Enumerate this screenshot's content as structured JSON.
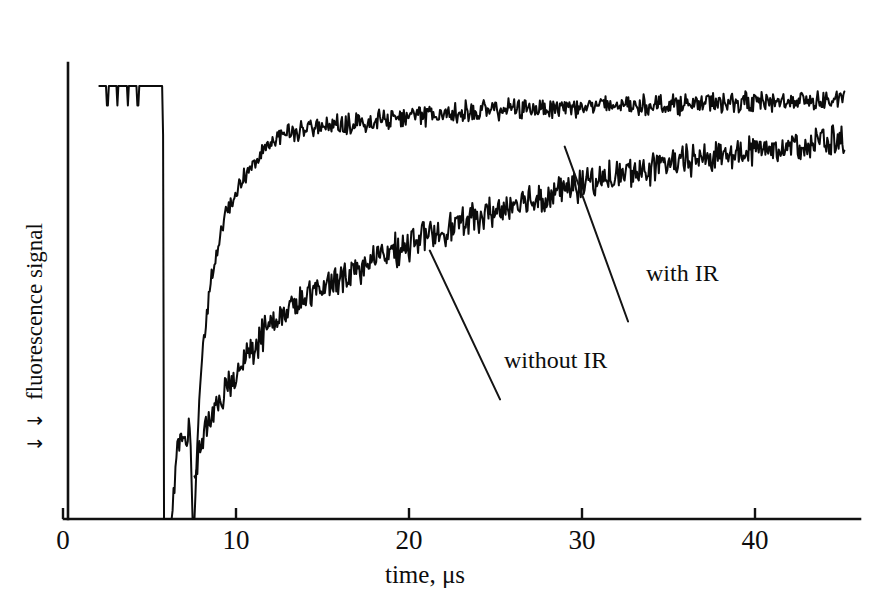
{
  "figure": {
    "background_color": "#ffffff",
    "ink_color": "#0b0b0b"
  },
  "axes": {
    "x_label": "time, μs",
    "y_label": "fluorescence signal",
    "y_label_arrows": "↓ ↓",
    "x_tick_labels": [
      "0",
      "10",
      "20",
      "30",
      "40"
    ],
    "x_tick_values": [
      0,
      10,
      20,
      30,
      40
    ],
    "y_ticks_shown": false
  },
  "annotations": {
    "with_ir": "with IR",
    "without_ir": "without IR"
  },
  "chart_data": {
    "type": "line",
    "title": "",
    "subtitle": "",
    "xlabel": "time, μs",
    "ylabel": "fluorescence signal",
    "xlim": [
      0,
      46
    ],
    "ylim": [
      0,
      1.05
    ],
    "grid": false,
    "legend_position": "inline-annotations",
    "y_axis_note": "arbitrary units, axis inverted in sense of arrows; higher trace = stronger fluorescence",
    "annotations": [
      {
        "text": "with IR",
        "x": 32.2,
        "y": 0.47,
        "leader_from_x": 29.0,
        "leader_from_y": 0.86
      },
      {
        "text": "without IR",
        "x": 24.8,
        "y": 0.29,
        "leader_from_x": 21.2,
        "leader_from_y": 0.62
      }
    ],
    "series": [
      {
        "name": "with IR",
        "description": "Pre-pulse flat baseline, sharp drop to zero at ~5.8 us, brief noisy partial recovery, second sharp drop to zero at ~7.4 us, then rapid rise to a plateau by ~13 us which stays nearly flat with noise to the end.",
        "noise_amplitude": 0.018,
        "x": [
          2.1,
          3.0,
          4.0,
          5.0,
          5.6,
          5.78,
          5.82,
          6.3,
          6.6,
          6.9,
          7.1,
          7.25,
          7.35,
          7.42,
          7.48,
          7.6,
          7.9,
          8.2,
          8.5,
          8.9,
          9.3,
          9.8,
          10.3,
          10.9,
          11.5,
          12.2,
          13.0,
          14.0,
          15.0,
          16.0,
          17.0,
          18.0,
          19.0,
          20.0,
          21.0,
          22.0,
          23.0,
          24.0,
          25.0,
          26.0,
          27.0,
          28.0,
          29.0,
          30.0,
          31.0,
          32.0,
          33.0,
          34.0,
          35.0,
          36.0,
          37.0,
          38.0,
          39.0,
          40.0,
          41.0,
          42.0,
          43.0,
          44.0,
          45.2
        ],
        "y": [
          1.0,
          1.0,
          1.0,
          1.0,
          1.0,
          1.0,
          0.0,
          0.0,
          0.17,
          0.2,
          0.18,
          0.21,
          0.19,
          0.12,
          0.0,
          0.0,
          0.3,
          0.44,
          0.54,
          0.62,
          0.69,
          0.74,
          0.78,
          0.82,
          0.855,
          0.875,
          0.89,
          0.9,
          0.905,
          0.91,
          0.915,
          0.92,
          0.925,
          0.928,
          0.932,
          0.936,
          0.94,
          0.942,
          0.945,
          0.947,
          0.949,
          0.951,
          0.952,
          0.953,
          0.954,
          0.955,
          0.956,
          0.957,
          0.958,
          0.959,
          0.96,
          0.961,
          0.962,
          0.963,
          0.964,
          0.965,
          0.966,
          0.967,
          0.968
        ]
      },
      {
        "name": "without IR",
        "description": "Same pre-pulse baseline and double drop, but recovery is much slower: rises steadily from ~8 us and is still climbing at 45 us, never reaching the with-IR plateau.",
        "noise_amplitude": 0.028,
        "x": [
          7.6,
          7.9,
          8.2,
          8.6,
          9.0,
          9.5,
          10.0,
          10.6,
          11.2,
          11.8,
          12.5,
          13.2,
          14.0,
          15.0,
          16.0,
          17.0,
          18.0,
          19.0,
          20.0,
          21.0,
          22.0,
          23.0,
          24.0,
          25.0,
          26.0,
          27.0,
          28.0,
          29.0,
          30.0,
          31.0,
          32.0,
          33.0,
          34.0,
          35.0,
          36.0,
          37.0,
          38.0,
          39.0,
          40.0,
          41.0,
          42.0,
          43.0,
          44.0,
          45.2
        ],
        "y": [
          0.1,
          0.16,
          0.2,
          0.235,
          0.265,
          0.3,
          0.335,
          0.375,
          0.41,
          0.44,
          0.465,
          0.487,
          0.508,
          0.535,
          0.558,
          0.578,
          0.598,
          0.617,
          0.635,
          0.652,
          0.668,
          0.683,
          0.697,
          0.711,
          0.724,
          0.737,
          0.749,
          0.761,
          0.772,
          0.783,
          0.793,
          0.802,
          0.811,
          0.819,
          0.827,
          0.834,
          0.841,
          0.847,
          0.853,
          0.858,
          0.863,
          0.868,
          0.872,
          0.876
        ]
      }
    ]
  }
}
